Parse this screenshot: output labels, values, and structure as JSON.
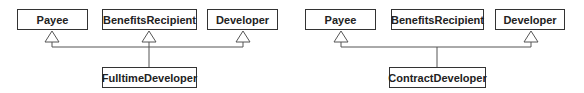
{
  "diagrams": [
    {
      "name": "fulltime",
      "classes": {
        "payee": "Payee",
        "benefits": "BenefitsRecipient",
        "developer": "Developer",
        "child": "FulltimeDeveloper"
      },
      "inherits": [
        "Payee",
        "BenefitsRecipient",
        "Developer"
      ]
    },
    {
      "name": "contract",
      "classes": {
        "payee": "Payee",
        "benefits": "BenefitsRecipient",
        "developer": "Developer",
        "child": "ContractDeveloper"
      },
      "inherits": [
        "Payee",
        "Developer"
      ]
    }
  ],
  "colors": {
    "line": "#555555",
    "border": "#333333",
    "text": "#222222"
  }
}
